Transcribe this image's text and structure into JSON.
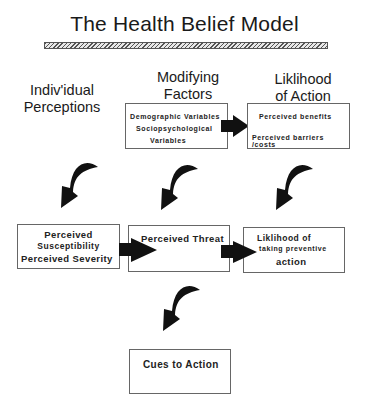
{
  "title": "The Health Belief Model",
  "columns": {
    "individual": [
      "Indiv'idual",
      "Perceptions"
    ],
    "modifying": [
      "Modifying",
      "Factors"
    ],
    "likelihood": [
      "Liklihood",
      "of Action"
    ]
  },
  "boxes": {
    "modifying_factors": {
      "lines": [
        "Demographic  Variables",
        "Sociopsychological",
        "Variables"
      ]
    },
    "likelihood_action": {
      "lines": [
        "Perceived benefits",
        "Perceived barriers /costs"
      ]
    },
    "perceptions": {
      "lines": [
        "Perceived",
        "Susceptibility",
        "Perceived Severity"
      ]
    },
    "threat": {
      "lines": [
        "Perceived Threat"
      ]
    },
    "preventive": {
      "lines": [
        "Liklihood of",
        "taking preventive",
        "action"
      ]
    },
    "cues": {
      "lines": [
        "Cues to Action"
      ]
    }
  },
  "connectors": [
    {
      "type": "straight-arrow",
      "from": "modifying_factors",
      "to": "likelihood_action"
    },
    {
      "type": "curved-arrow",
      "from": "individual-perceptions",
      "to": "perceptions"
    },
    {
      "type": "curved-arrow",
      "from": "modifying_factors",
      "to": "threat"
    },
    {
      "type": "curved-arrow",
      "from": "likelihood_action",
      "to": "preventive"
    },
    {
      "type": "straight-arrow",
      "from": "perceptions",
      "to": "threat"
    },
    {
      "type": "straight-arrow",
      "from": "threat",
      "to": "preventive"
    },
    {
      "type": "curved-arrow",
      "from": "threat",
      "to": "cues"
    }
  ]
}
